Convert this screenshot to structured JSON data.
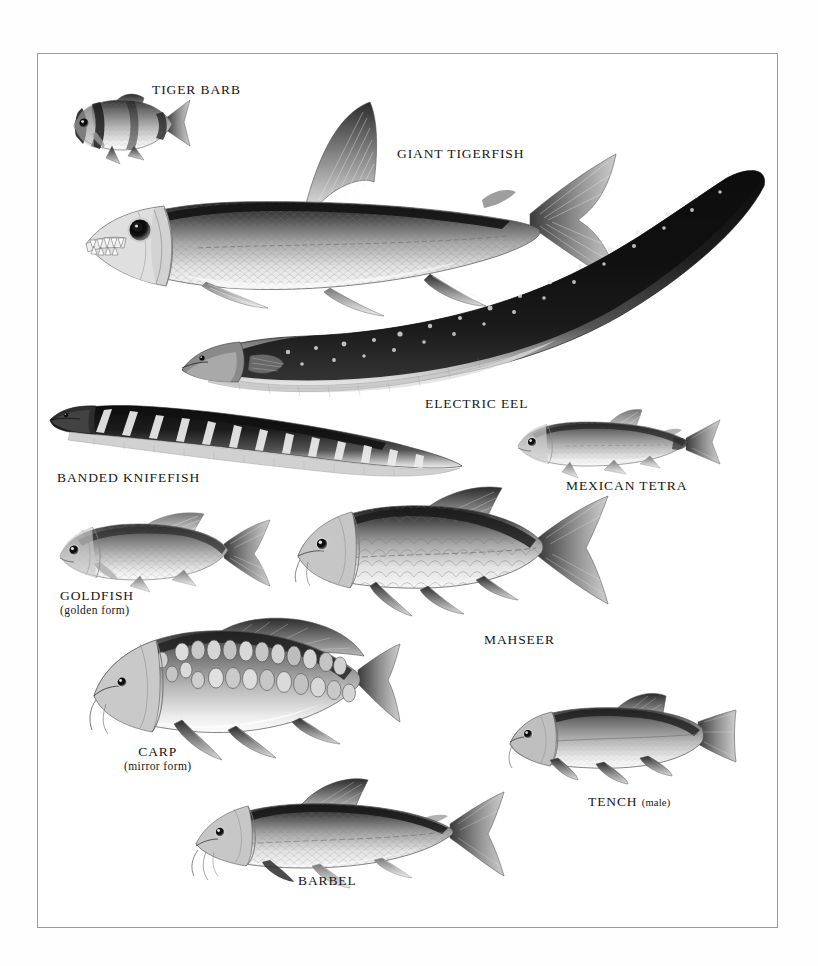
{
  "page": {
    "kind": "natural-history-reference-plate",
    "background_color": "#ffffff",
    "frame_color": "#9a9a9a",
    "palette": {
      "ink": "#161616",
      "dark": "#2b2b2b",
      "mid": "#7d7d7d",
      "light": "#d8d8d8",
      "paper": "#ffffff"
    }
  },
  "labels": {
    "tiger_barb": {
      "name": "TIGER BARB"
    },
    "giant_tigerfish": {
      "name": "GIANT TIGERFISH"
    },
    "electric_eel": {
      "name": "ELECTRIC EEL"
    },
    "banded_knifefish": {
      "name": "BANDED KNIFEFISH"
    },
    "mexican_tetra": {
      "name": "MEXICAN TETRA"
    },
    "goldfish": {
      "name": "GOLDFISH",
      "qualifier": "(golden form)"
    },
    "mahseer": {
      "name": "MAHSEER"
    },
    "carp": {
      "name": "CARP",
      "qualifier": "(mirror form)"
    },
    "tench": {
      "name": "TENCH",
      "qualifier": "(male)"
    },
    "barbel": {
      "name": "BARBEL"
    }
  },
  "figures": [
    {
      "id": "tiger-barb",
      "label": "TIGER BARB",
      "facing": "left",
      "traits": "deep-bodied, four dark vertical bars, forked tail"
    },
    {
      "id": "giant-tigerfish",
      "label": "GIANT TIGERFISH",
      "facing": "left",
      "traits": "large exposed conical teeth, big eye, silver scales, dark dorsal ridge, deeply forked tail"
    },
    {
      "id": "electric-eel",
      "label": "ELECTRIC EEL",
      "facing": "left",
      "traits": "very elongated dark body, pale spots, long anal fin, pale throat"
    },
    {
      "id": "banded-knifefish",
      "label": "BANDED KNIFEFISH",
      "facing": "left",
      "traits": "knife-shaped body, oblique pale bands, continuous anal fin"
    },
    {
      "id": "mexican-tetra",
      "label": "MEXICAN TETRA",
      "facing": "left",
      "traits": "small silver characin, adipose fin, forked tail"
    },
    {
      "id": "goldfish",
      "label": "GOLDFISH",
      "facing": "left",
      "traits": "golden form, rounded body, fanned tail"
    },
    {
      "id": "mahseer",
      "label": "MAHSEER",
      "facing": "left",
      "traits": "large cyprinid, big scales, barbels, forked tail"
    },
    {
      "id": "carp",
      "label": "CARP",
      "facing": "left",
      "traits": "mirror form, irregular rows of large scales, barbels, long dorsal fin"
    },
    {
      "id": "tench",
      "label": "TENCH",
      "facing": "left",
      "traits": "male, thick body, rounded fins, small scales"
    },
    {
      "id": "barbel",
      "label": "BARBEL",
      "facing": "left",
      "traits": "streamlined, pointed snout, barbels, high dorsal fin"
    }
  ]
}
